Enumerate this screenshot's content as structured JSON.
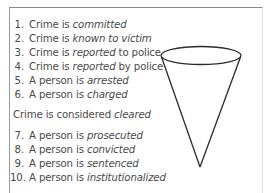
{
  "diagram": {
    "type": "funnel",
    "stages_before": [
      {
        "num": "1.",
        "prefix": "Crime is ",
        "emph": "committed",
        "suffix": ""
      },
      {
        "num": "2.",
        "prefix": "Crime is ",
        "emph": "known to victim",
        "suffix": ""
      },
      {
        "num": "3.",
        "prefix": "Crime is ",
        "emph": "reported",
        "suffix": " to police"
      },
      {
        "num": "4.",
        "prefix": "Crime is ",
        "emph": "reported",
        "suffix": " by police"
      },
      {
        "num": "5.",
        "prefix": "A person is ",
        "emph": "arrested",
        "suffix": ""
      },
      {
        "num": "6.",
        "prefix": "A person is ",
        "emph": "charged",
        "suffix": ""
      }
    ],
    "divider": {
      "prefix": "Crime is considered ",
      "emph": "cleared"
    },
    "stages_after": [
      {
        "num": "7.",
        "prefix": "A person is ",
        "emph": "prosecuted",
        "suffix": ""
      },
      {
        "num": "8.",
        "prefix": "A person is ",
        "emph": "convicted",
        "suffix": ""
      },
      {
        "num": "9.",
        "prefix": "A person is ",
        "emph": "sentenced",
        "suffix": ""
      },
      {
        "num": "10.",
        "prefix": "A person is ",
        "emph": "institutionalized",
        "suffix": ""
      }
    ],
    "colors": {
      "text": "#4a4a4a",
      "funnel_stroke": "#2b2b2b",
      "frame_border": "#8a8a8a"
    }
  }
}
